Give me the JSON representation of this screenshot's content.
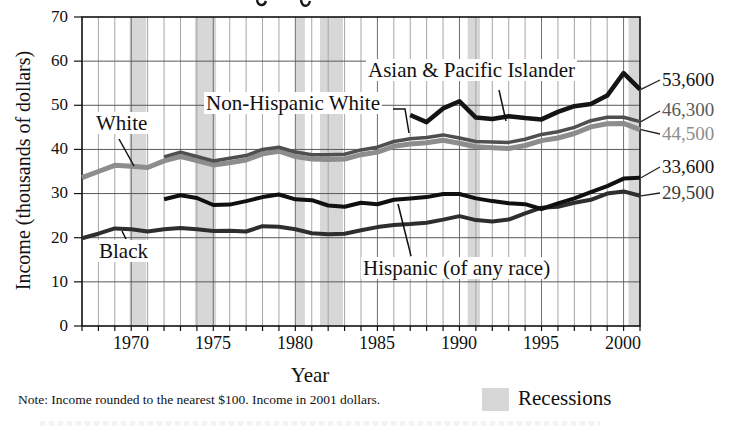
{
  "page": {
    "note": "Note: Income rounded to the nearest $100. Income in 2001 dollars.",
    "legend": {
      "label": "Recessions",
      "swatch_color": "#d7d7d7"
    }
  },
  "chart_data": {
    "type": "line",
    "xlabel": "Year",
    "ylabel": "Income (thousands of dollars)",
    "x_range": [
      1967,
      2001
    ],
    "ylim": [
      0,
      70
    ],
    "ytick_labels": [
      "0",
      "10",
      "20",
      "30",
      "40",
      "50",
      "60",
      "70"
    ],
    "xtick_labels": [
      "1970",
      "1975",
      "1980",
      "1985",
      "1990",
      "1995",
      "2000"
    ],
    "grid": {
      "vertical": "every year",
      "horizontal": "every 10 (thousands)"
    },
    "units": "thousands of 2001 dollars",
    "series": [
      {
        "name": "white",
        "label": "White",
        "color": "#8d8d8d",
        "end_label": "44,500",
        "end_label_color": "#8d8d8d",
        "start_year": 1967,
        "values": [
          33.6,
          35.0,
          36.4,
          36.2,
          35.9,
          37.4,
          38.4,
          37.5,
          36.5,
          37.0,
          37.6,
          39.0,
          39.6,
          38.4,
          37.8,
          37.7,
          37.8,
          38.8,
          39.4,
          40.7,
          41.2,
          41.5,
          42.1,
          41.4,
          40.6,
          40.4,
          40.2,
          40.9,
          42.0,
          42.6,
          43.6,
          45.1,
          45.8,
          45.9,
          44.5
        ]
      },
      {
        "name": "non-hispanic-white",
        "label": "Non-Hispanic White",
        "color": "#4f4f4f",
        "end_label": "46,300",
        "end_label_color": "#5a5a5a",
        "start_year": 1972,
        "values": [
          38.3,
          39.4,
          38.4,
          37.4,
          38.0,
          38.6,
          40.0,
          40.5,
          39.4,
          38.8,
          38.8,
          38.9,
          39.9,
          40.5,
          41.8,
          42.4,
          42.7,
          43.3,
          42.6,
          41.8,
          41.7,
          41.6,
          42.3,
          43.4,
          44.0,
          45.0,
          46.5,
          47.3,
          47.3,
          46.3
        ]
      },
      {
        "name": "asian-pacific-islander",
        "label": "Asian & Pacific Islander",
        "color": "#141414",
        "end_label": "53,600",
        "end_label_color": "#141414",
        "start_year": 1987,
        "values": [
          47.8,
          46.2,
          49.3,
          50.9,
          47.2,
          46.9,
          47.5,
          47.1,
          46.8,
          48.5,
          49.8,
          50.3,
          52.2,
          57.3,
          53.6
        ]
      },
      {
        "name": "black",
        "label": "Black",
        "color": "#2e2e2e",
        "end_label": "29,500",
        "end_label_color": "#3c3c3c",
        "start_year": 1967,
        "values": [
          19.9,
          20.9,
          22.1,
          21.9,
          21.4,
          21.9,
          22.2,
          21.9,
          21.5,
          21.6,
          21.4,
          22.6,
          22.5,
          21.9,
          21.0,
          20.8,
          20.9,
          21.7,
          22.4,
          22.9,
          23.1,
          23.4,
          24.1,
          24.9,
          24.0,
          23.7,
          24.1,
          25.5,
          26.8,
          27.0,
          27.9,
          28.6,
          30.0,
          30.5,
          29.5
        ]
      },
      {
        "name": "hispanic",
        "label": "Hispanic (of any race)",
        "color": "#101010",
        "end_label": "33,600",
        "end_label_color": "#141414",
        "start_year": 1972,
        "values": [
          28.7,
          29.6,
          29.0,
          27.4,
          27.5,
          28.3,
          29.2,
          29.8,
          28.7,
          28.5,
          27.3,
          27.0,
          27.9,
          27.6,
          28.6,
          28.9,
          29.2,
          29.9,
          29.9,
          28.9,
          28.3,
          27.8,
          27.6,
          26.5,
          27.8,
          28.9,
          30.3,
          31.7,
          33.4,
          33.6
        ]
      }
    ],
    "recessions": [
      [
        1969.9,
        1970.92
      ],
      [
        1973.88,
        1975.17
      ],
      [
        1980.0,
        1980.58
      ],
      [
        1981.5,
        1982.9
      ],
      [
        1990.5,
        1991.25
      ],
      [
        2000.3,
        2001.0
      ]
    ],
    "legend_position": "bottom-right",
    "colors": {
      "recession_band": "#d7d7d7",
      "grid_year": "#a6a6a6",
      "grid_5year": "#6f6f6f",
      "grid_horizontal": "#595959",
      "frame": "#111111"
    }
  }
}
